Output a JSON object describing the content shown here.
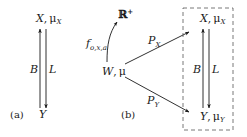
{
  "panel_a": {
    "caption": "(a)",
    "top_node": {
      "var": "X",
      "sep": ",",
      "measure": "μ",
      "measure_sub": "X"
    },
    "bottom_node": {
      "var": "Y"
    },
    "up_arrow_label": "B",
    "down_arrow_label": "L"
  },
  "panel_b": {
    "caption": "(b)",
    "source_node": {
      "var": "W",
      "sep": ",",
      "measure": "μ"
    },
    "target_space": {
      "symbol": "ℝ",
      "sup": "+"
    },
    "map_label": {
      "symbol": "f",
      "sub": "o,x,a"
    },
    "edge_to_x": {
      "symbol": "P",
      "sub": "X"
    },
    "edge_to_y": {
      "symbol": "P",
      "sub": "Y"
    },
    "boxed": {
      "top_node": {
        "var": "X",
        "sep": ",",
        "measure": "μ",
        "measure_sub": "X"
      },
      "bottom_node": {
        "var": "Y",
        "sep": ",",
        "measure": "μ",
        "measure_sub": "Y"
      },
      "up_arrow_label": "B",
      "down_arrow_label": "L"
    }
  },
  "colors": {
    "ink": "#1a1a1a",
    "dashed_box": "#555555",
    "background": "#ffffff"
  }
}
